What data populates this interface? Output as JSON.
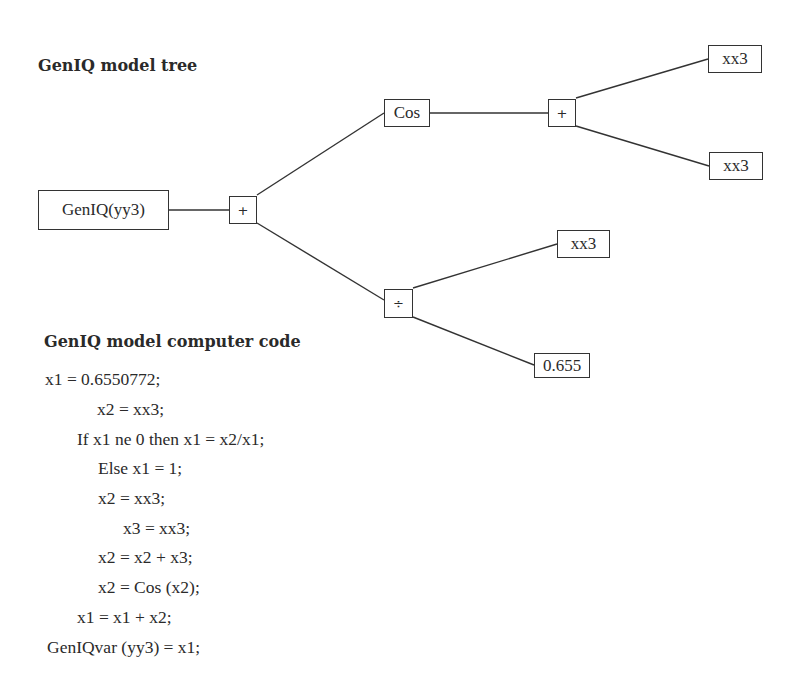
{
  "tree_section": {
    "title": "GenIQ model tree",
    "nodes": {
      "root": "GenIQ(yy3)",
      "plus_main": "+",
      "cos": "Cos",
      "plus_upper": "+",
      "xx3_a": "xx3",
      "xx3_b": "xx3",
      "divide": "÷",
      "xx3_c": "xx3",
      "const": "0.655"
    },
    "edges": [
      [
        "root",
        "plus_main"
      ],
      [
        "plus_main",
        "cos"
      ],
      [
        "plus_main",
        "divide"
      ],
      [
        "cos",
        "plus_upper"
      ],
      [
        "plus_upper",
        "xx3_a"
      ],
      [
        "plus_upper",
        "xx3_b"
      ],
      [
        "divide",
        "xx3_c"
      ],
      [
        "divide",
        "const"
      ]
    ]
  },
  "code_section": {
    "title": "GenIQ model computer code",
    "lines": [
      "x1 = 0.6550772;",
      "x2 = xx3;",
      "If x1 ne 0 then x1 = x2/x1;",
      "Else x1 = 1;",
      "x2 = xx3;",
      "x3 = xx3;",
      "x2 = x2 + x3;",
      "x2 = Cos (x2);",
      "x1 = x1 + x2;",
      "GenIQvar (yy3) = x1;"
    ]
  }
}
